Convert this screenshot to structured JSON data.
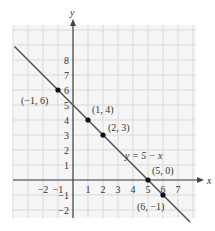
{
  "chart_data": {
    "type": "line",
    "title": "",
    "xlabel": "x",
    "ylabel": "y",
    "xlim": [
      -3,
      7
    ],
    "ylim": [
      -2,
      8
    ],
    "grid": true,
    "x_ticks": [
      -2,
      -1,
      1,
      2,
      3,
      4,
      5,
      6,
      7
    ],
    "y_ticks": [
      -2,
      -1,
      1,
      2,
      3,
      4,
      5,
      6,
      7,
      8
    ],
    "series": [
      {
        "name": "y = 5 − x",
        "equation": "y = 5 - x",
        "slope": -1,
        "intercept": 5,
        "color": "#555555"
      }
    ],
    "points": [
      {
        "x": -1,
        "y": 6,
        "label": "(−1, 6)"
      },
      {
        "x": 1,
        "y": 4,
        "label": "(1, 4)"
      },
      {
        "x": 2,
        "y": 3,
        "label": "(2, 3)"
      },
      {
        "x": 5,
        "y": 0,
        "label": "(5, 0)"
      },
      {
        "x": 6,
        "y": -1,
        "label": "(6, −1)"
      }
    ],
    "annotations": [
      {
        "text": "y = 5 − x",
        "near": [
          3.5,
          1.5
        ]
      }
    ]
  },
  "colors": {
    "grid": "#d9d9d9",
    "axis": "#444444",
    "line": "#555555",
    "point": "#111111",
    "text": "#333333"
  }
}
